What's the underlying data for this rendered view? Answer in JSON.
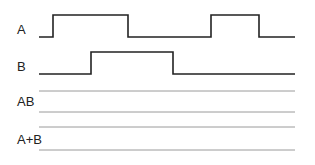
{
  "diagram": {
    "colors": {
      "signal": "#222222",
      "blank_line": "#9a9a9a",
      "background": "#ffffff"
    },
    "signals": [
      {
        "label": "A",
        "label_pos": [
          17,
          34
        ],
        "high_y": 15,
        "low_y": 37,
        "points": [
          [
            39,
            37
          ],
          [
            53,
            37
          ],
          [
            53,
            15
          ],
          [
            128,
            15
          ],
          [
            128,
            37
          ],
          [
            211,
            37
          ],
          [
            211,
            15
          ],
          [
            259,
            15
          ],
          [
            259,
            37
          ],
          [
            295,
            37
          ]
        ]
      },
      {
        "label": "B",
        "label_pos": [
          17,
          71
        ],
        "high_y": 52,
        "low_y": 74,
        "points": [
          [
            39,
            74
          ],
          [
            91,
            74
          ],
          [
            91,
            52
          ],
          [
            173,
            52
          ],
          [
            173,
            74
          ],
          [
            295,
            74
          ]
        ]
      }
    ],
    "answer_rows": [
      {
        "label": "AB",
        "label_pos": [
          17,
          106
        ],
        "lines_y": [
          91,
          112
        ],
        "x_start": 39,
        "x_end": 295
      },
      {
        "label": "A+B",
        "label_pos": [
          17,
          144
        ],
        "lines_y": [
          127,
          150
        ],
        "x_start": 39,
        "x_end": 295
      }
    ]
  }
}
